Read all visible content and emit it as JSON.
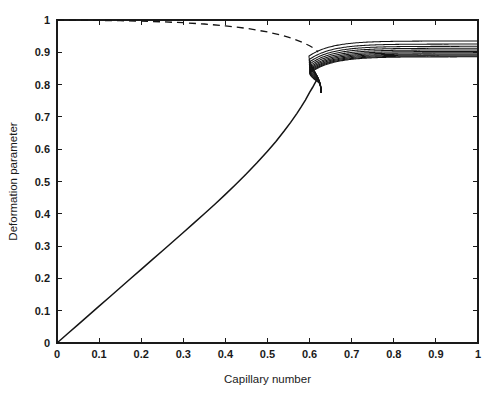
{
  "chart_data": {
    "type": "line",
    "title": "",
    "xlabel": "Capillary number",
    "ylabel": "Deformation parameter",
    "xlim": [
      0,
      1
    ],
    "ylim": [
      0,
      1
    ],
    "xticks": [
      "0",
      "0.1",
      "0.2",
      "0.3",
      "0.4",
      "0.5",
      "0.6",
      "0.7",
      "0.8",
      "0.9",
      "1"
    ],
    "xtick_values": [
      0,
      0.1,
      0.2,
      0.3,
      0.4,
      0.5,
      0.6,
      0.7,
      0.8,
      0.9,
      1
    ],
    "yticks": [
      "0",
      "0.1",
      "0.2",
      "0.3",
      "0.4",
      "0.5",
      "0.6",
      "0.7",
      "0.8",
      "0.9",
      "1"
    ],
    "ytick_values": [
      0,
      0.1,
      0.2,
      0.3,
      0.4,
      0.5,
      0.6,
      0.7,
      0.8,
      0.9,
      1
    ],
    "grid": false,
    "legend": null,
    "legend_position": "none",
    "line_color": "#141414",
    "background": "#ffffff",
    "series": [
      {
        "name": "lower-branch",
        "style": "solid",
        "linewidth": 1.5,
        "x": [
          0,
          0.025,
          0.05,
          0.075,
          0.1,
          0.125,
          0.15,
          0.175,
          0.2,
          0.225,
          0.25,
          0.275,
          0.3,
          0.325,
          0.35,
          0.375,
          0.4,
          0.425,
          0.45,
          0.475,
          0.5,
          0.52,
          0.54,
          0.555,
          0.57,
          0.58,
          0.59,
          0.6,
          0.607,
          0.613,
          0.617,
          0.62
        ],
        "values": [
          0,
          0.0285,
          0.057,
          0.0855,
          0.114,
          0.1425,
          0.171,
          0.1995,
          0.228,
          0.2565,
          0.285,
          0.3135,
          0.342,
          0.371,
          0.4,
          0.4295,
          0.46,
          0.4915,
          0.524,
          0.558,
          0.594,
          0.624,
          0.657,
          0.683,
          0.711,
          0.731,
          0.752,
          0.776,
          0.791,
          0.805,
          0.815,
          0.822
        ]
      },
      {
        "name": "upper-branch-dashed",
        "style": "dashed",
        "linewidth": 1.3,
        "x": [
          0,
          0.05,
          0.1,
          0.15,
          0.2,
          0.25,
          0.3,
          0.35,
          0.4,
          0.45,
          0.5,
          0.53,
          0.56,
          0.58,
          0.6,
          0.61,
          0.617,
          0.62
        ],
        "values": [
          1.0,
          0.9995,
          0.9988,
          0.9978,
          0.9964,
          0.9944,
          0.9916,
          0.9876,
          0.982,
          0.9742,
          0.963,
          0.9542,
          0.9424,
          0.9326,
          0.9202,
          0.9122,
          0.9048,
          0.9005
        ]
      },
      {
        "name": "branch-01",
        "style": "solid",
        "linewidth": 1.05,
        "plateau": 0.935,
        "turn_x": 0.605,
        "turn_y": 0.855
      },
      {
        "name": "branch-02",
        "style": "solid",
        "linewidth": 1.05,
        "plateau": 0.9255,
        "turn_x": 0.6105,
        "turn_y": 0.843
      },
      {
        "name": "branch-03",
        "style": "solid",
        "linewidth": 1.05,
        "plateau": 0.9185,
        "turn_x": 0.6145,
        "turn_y": 0.8345
      },
      {
        "name": "branch-04",
        "style": "solid",
        "linewidth": 1.05,
        "plateau": 0.9125,
        "turn_x": 0.6175,
        "turn_y": 0.8275
      },
      {
        "name": "branch-05",
        "style": "solid",
        "linewidth": 1.05,
        "plateau": 0.9072,
        "turn_x": 0.6198,
        "turn_y": 0.8218
      },
      {
        "name": "branch-06",
        "style": "solid",
        "linewidth": 1.05,
        "plateau": 0.9025,
        "turn_x": 0.6215,
        "turn_y": 0.8168
      },
      {
        "name": "branch-07",
        "style": "solid",
        "linewidth": 1.05,
        "plateau": 0.8985,
        "turn_x": 0.6228,
        "turn_y": 0.8125
      },
      {
        "name": "branch-08",
        "style": "solid",
        "linewidth": 1.05,
        "plateau": 0.8948,
        "turn_x": 0.6238,
        "turn_y": 0.8088
      },
      {
        "name": "branch-09",
        "style": "solid",
        "linewidth": 1.05,
        "plateau": 0.8915,
        "turn_x": 0.6246,
        "turn_y": 0.8055
      },
      {
        "name": "branch-10",
        "style": "solid",
        "linewidth": 1.05,
        "plateau": 0.8885,
        "turn_x": 0.6253,
        "turn_y": 0.8025
      },
      {
        "name": "branch-11",
        "style": "solid",
        "linewidth": 1.05,
        "plateau": 0.886,
        "turn_x": 0.6258,
        "turn_y": 0.7998
      }
    ]
  },
  "axes": {
    "x_title": "Capillary number",
    "y_title": "Deformation parameter"
  }
}
